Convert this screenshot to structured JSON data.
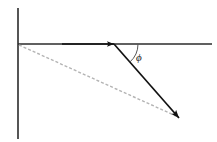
{
  "figure": {
    "type": "vector-diagram",
    "title": "",
    "background_color": "#ffffff",
    "width": 217,
    "height": 142,
    "labels": {
      "angle_symbol": "ϕ"
    },
    "colors": {
      "axis": "#2b2b2b",
      "solid_vector": "#111111",
      "dashed_vector": "#b4b4b4",
      "arc": "#555555",
      "label": "#1a1a1a"
    },
    "elements": {
      "vertical_axis": {
        "name": "vertical-axis",
        "x1": 18,
        "y1": 8,
        "x2": 18,
        "y2": 139,
        "stroke_width": 1.6,
        "style": "solid"
      },
      "horizontal_axis": {
        "name": "horizontal-axis",
        "x1": 18,
        "y1": 44,
        "x2": 212,
        "y2": 44,
        "stroke_width": 1.4,
        "style": "solid"
      },
      "horizontal_arrow": {
        "name": "horizontal-arrow",
        "x1": 60,
        "y1": 44,
        "x2": 114,
        "y2": 44,
        "stroke_width": 1.4,
        "style": "solid",
        "arrowhead": "end"
      },
      "solid_vector": {
        "name": "solid-vector",
        "x1": 114,
        "y1": 44,
        "x2": 180,
        "y2": 119,
        "stroke_width": 1.7,
        "style": "solid",
        "arrowhead": "end"
      },
      "dashed_vector": {
        "name": "dashed-vector",
        "x1": 19,
        "y1": 45,
        "x2": 176,
        "y2": 116,
        "stroke_width": 1.3,
        "style": "dashed",
        "dash_pattern": "3 2",
        "arrowhead": "none"
      },
      "angle_arc": {
        "name": "angle-arc",
        "center_x": 114,
        "center_y": 44,
        "radius": 24,
        "start_angle_deg": 0,
        "end_angle_deg": 49,
        "stroke_width": 1.0
      },
      "angle_label": {
        "name": "angle-label",
        "x": 136,
        "y": 61
      }
    }
  }
}
